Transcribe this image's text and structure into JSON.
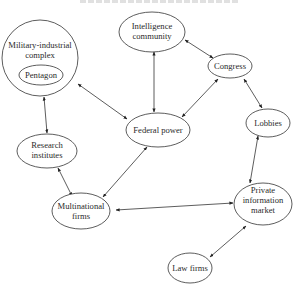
{
  "diagram": {
    "nodes": {
      "military_industrial_complex": {
        "label_lines": [
          "Military-industrial",
          "complex"
        ]
      },
      "pentagon": {
        "label_lines": [
          "Pentagon"
        ]
      },
      "intelligence_community": {
        "label_lines": [
          "Intelligence",
          "community"
        ]
      },
      "congress": {
        "label_lines": [
          "Congress"
        ]
      },
      "federal_power": {
        "label_lines": [
          "Federal power"
        ]
      },
      "lobbies": {
        "label_lines": [
          "Lobbies"
        ]
      },
      "research_institutes": {
        "label_lines": [
          "Research",
          "institutes"
        ]
      },
      "multinational_firms": {
        "label_lines": [
          "Multinational",
          "firms"
        ]
      },
      "private_information_market": {
        "label_lines": [
          "Private",
          "information",
          "market"
        ]
      },
      "law_firms": {
        "label_lines": [
          "Law firms"
        ]
      }
    },
    "edges": [
      {
        "from": "military_industrial_complex",
        "to": "federal_power",
        "arrows": "both"
      },
      {
        "from": "military_industrial_complex",
        "to": "research_institutes",
        "arrows": "both"
      },
      {
        "from": "intelligence_community",
        "to": "federal_power",
        "arrows": "both"
      },
      {
        "from": "intelligence_community",
        "to": "congress",
        "arrows": "both"
      },
      {
        "from": "congress",
        "to": "federal_power",
        "arrows": "both"
      },
      {
        "from": "congress",
        "to": "lobbies",
        "arrows": "both"
      },
      {
        "from": "lobbies",
        "to": "private_information_market",
        "arrows": "both"
      },
      {
        "from": "research_institutes",
        "to": "multinational_firms",
        "arrows": "both"
      },
      {
        "from": "federal_power",
        "to": "multinational_firms",
        "arrows": "both"
      },
      {
        "from": "multinational_firms",
        "to": "private_information_market",
        "arrows": "both"
      },
      {
        "from": "private_information_market",
        "to": "law_firms",
        "arrows": "both"
      }
    ]
  }
}
